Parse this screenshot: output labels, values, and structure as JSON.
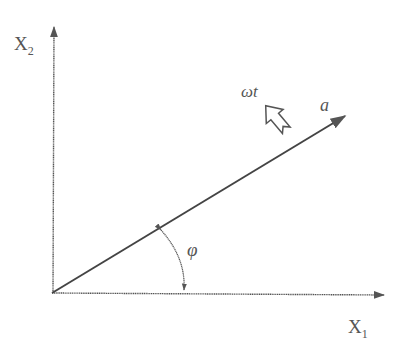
{
  "diagram": {
    "axes": {
      "x_axis_label": "X",
      "x_axis_subscript": "1",
      "y_axis_label": "X",
      "y_axis_subscript": "2"
    },
    "vector": {
      "label": "a"
    },
    "rotation": {
      "label": "ωt"
    },
    "angle": {
      "label": "φ"
    },
    "colors": {
      "line": "#555555",
      "background": "#ffffff"
    }
  }
}
